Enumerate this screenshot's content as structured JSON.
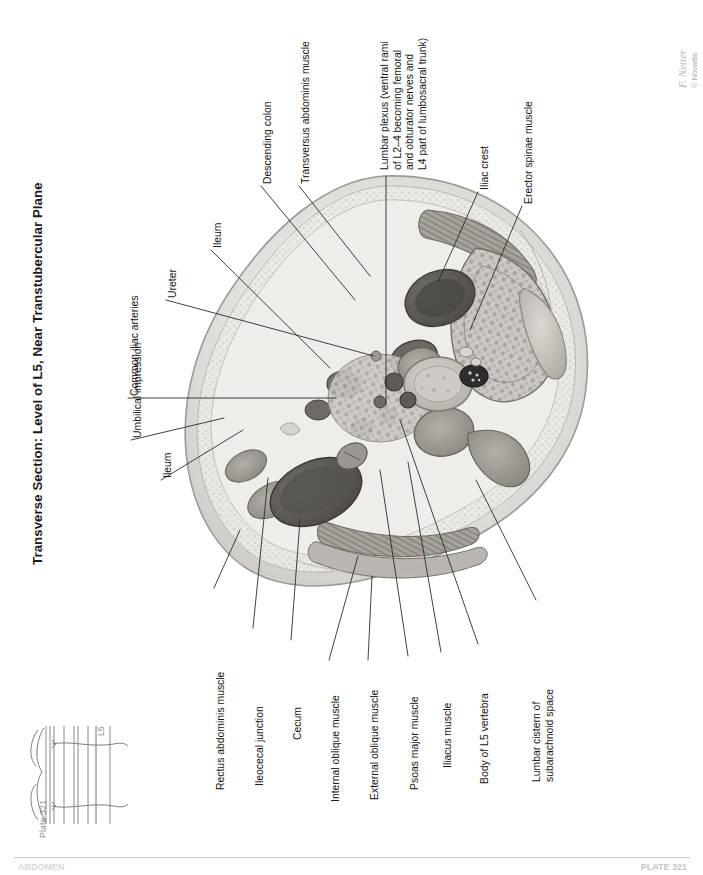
{
  "page": {
    "title": "Transverse Section: Level of L5, Near Transtubercular Plane",
    "plate_number": "Plate 321",
    "spine_level": "L5",
    "artist_signature": "F. Netter",
    "copyright": "© Novartis",
    "footer_left": "ABDOMEN",
    "footer_right": "PLATE 321"
  },
  "labels": {
    "descending_colon": "Descending colon",
    "transversus_abdominis": "Transversus abdominis muscle",
    "ileum_top": "Ileum",
    "ureter": "Ureter",
    "common_iliac_arteries": "Common iliac arteries",
    "umbilical_impression": "Umbilical impression",
    "ileum_left": "Ileum",
    "lumbar_plexus": "Lumbar plexus (ventral rami\nof L2–4 becoming femoral\nand obturator nerves and\nL4 part of lumbosacral trunk)",
    "iliac_crest": "Iliac crest",
    "erector_spinae": "Erector spinae muscle",
    "rectus_abdominis": "Rectus abdominis muscle",
    "ileocecal_junction": "Ileocecal junction",
    "cecum": "Cecum",
    "internal_oblique": "Internal oblique muscle",
    "external_oblique": "External oblique muscle",
    "psoas_major": "Psoas major muscle",
    "iliacus": "Iliacus muscle",
    "body_of_l5": "Body of L5 vertebra",
    "lumbar_cistern": "Lumbar cistern of\nsubarachnoid space"
  },
  "colors": {
    "ink": "#141414",
    "leader": "#2b2b2b",
    "tissue_light": "#e9e7e4",
    "tissue_mid": "#c3c0bb",
    "tissue_dark": "#8e8a85",
    "lumen_dark": "#5d5a57",
    "muted": "#9a9a9a"
  }
}
